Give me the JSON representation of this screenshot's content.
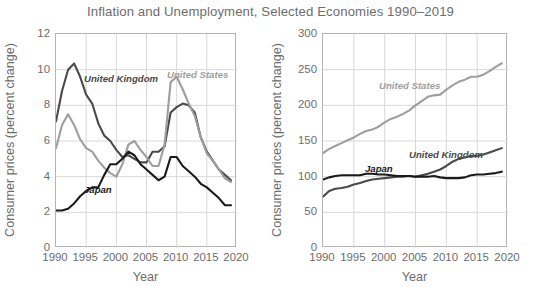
{
  "title": "Inflation and Unemployment, Selected Economies 1990–2019",
  "colors": {
    "united_kingdom": "#4a4a4a",
    "united_states": "#9e9e9e",
    "japan": "#1a1a1a",
    "axis": "#b4b4b4",
    "grid": "#d8d8d8",
    "text": "#6d6d6d"
  },
  "left": {
    "ylabel": "Consumer prices (percent change)",
    "xlabel": "Year",
    "yticks": [
      "0",
      "2",
      "4",
      "6",
      "8",
      "10",
      "12"
    ],
    "xticks": [
      "1990",
      "1995",
      "2000",
      "2005",
      "2010",
      "2015",
      "2020"
    ],
    "series_labels": {
      "united_kingdom": "United Kingdom",
      "united_states": "United States",
      "japan": "Japan"
    }
  },
  "right": {
    "ylabel": "Consumer prices (percent change)",
    "xlabel": "Year",
    "yticks": [
      "0",
      "50",
      "100",
      "150",
      "200",
      "250",
      "300"
    ],
    "xticks": [
      "1990",
      "1995",
      "2000",
      "2005",
      "2010",
      "2015",
      "2020"
    ],
    "series_labels": {
      "united_kingdom": "United Kingdom",
      "united_states": "United States",
      "japan": "Japan"
    }
  },
  "chart_data": [
    {
      "type": "line",
      "id": "left-panel",
      "title": "Inflation and Unemployment, Selected Economies 1990–2019",
      "xlabel": "Year",
      "ylabel": "Consumer prices (percent change)",
      "xlim": [
        1990,
        2020
      ],
      "ylim": [
        0,
        12
      ],
      "xticks": [
        1990,
        1995,
        2000,
        2005,
        2010,
        2015,
        2020
      ],
      "yticks": [
        0,
        2,
        4,
        6,
        8,
        10,
        12
      ],
      "grid": true,
      "legend": "inline-annotations",
      "x": [
        1990,
        1991,
        1992,
        1993,
        1994,
        1995,
        1996,
        1997,
        1998,
        1999,
        2000,
        2001,
        2002,
        2003,
        2004,
        2005,
        2006,
        2007,
        2008,
        2009,
        2010,
        2011,
        2012,
        2013,
        2014,
        2015,
        2016,
        2017,
        2018,
        2019
      ],
      "series": [
        {
          "name": "United Kingdom",
          "color": "#4a4a4a",
          "values": [
            7.1,
            8.8,
            10.0,
            10.35,
            9.6,
            8.6,
            8.1,
            7.0,
            6.3,
            6.0,
            5.5,
            5.1,
            5.2,
            5.0,
            4.8,
            4.8,
            5.4,
            5.4,
            5.7,
            7.6,
            7.9,
            8.1,
            8.0,
            7.6,
            6.2,
            5.4,
            4.9,
            4.4,
            4.1,
            3.8
          ],
          "series_type": "unemployment_rate_percent"
        },
        {
          "name": "United States",
          "color": "#9e9e9e",
          "values": [
            5.6,
            6.9,
            7.5,
            6.9,
            6.1,
            5.6,
            5.4,
            4.9,
            4.5,
            4.2,
            4.0,
            4.7,
            5.8,
            6.0,
            5.5,
            5.1,
            4.6,
            4.6,
            5.8,
            9.3,
            9.6,
            8.9,
            8.1,
            7.4,
            6.2,
            5.3,
            4.9,
            4.4,
            3.9,
            3.7
          ],
          "series_type": "unemployment_rate_percent"
        },
        {
          "name": "Japan",
          "color": "#1a1a1a",
          "values": [
            2.1,
            2.1,
            2.2,
            2.5,
            2.9,
            3.2,
            3.4,
            3.4,
            4.1,
            4.7,
            4.7,
            5.0,
            5.4,
            5.2,
            4.7,
            4.4,
            4.1,
            3.8,
            4.0,
            5.1,
            5.1,
            4.6,
            4.3,
            4.0,
            3.6,
            3.4,
            3.1,
            2.8,
            2.4,
            2.4
          ],
          "series_type": "unemployment_rate_percent"
        }
      ]
    },
    {
      "type": "line",
      "id": "right-panel",
      "title": "Inflation and Unemployment, Selected Economies 1990–2019",
      "xlabel": "Year",
      "ylabel": "Consumer prices (percent change)",
      "xlim": [
        1990,
        2020
      ],
      "ylim": [
        0,
        300
      ],
      "xticks": [
        1990,
        1995,
        2000,
        2005,
        2010,
        2015,
        2020
      ],
      "yticks": [
        0,
        50,
        100,
        150,
        200,
        250,
        300
      ],
      "grid": true,
      "legend": "inline-annotations",
      "x": [
        1990,
        1991,
        1992,
        1993,
        1994,
        1995,
        1996,
        1997,
        1998,
        1999,
        2000,
        2001,
        2002,
        2003,
        2004,
        2005,
        2006,
        2007,
        2008,
        2009,
        2010,
        2011,
        2012,
        2013,
        2014,
        2015,
        2016,
        2017,
        2018,
        2019
      ],
      "series": [
        {
          "name": "United States",
          "color": "#9e9e9e",
          "values": [
            133,
            139,
            143,
            147,
            151,
            155,
            160,
            164,
            166,
            170,
            176,
            181,
            184,
            188,
            193,
            200,
            206,
            212,
            214,
            215,
            222,
            228,
            233,
            236,
            240,
            240,
            243,
            248,
            254,
            259
          ],
          "series_type": "price_index_2005_equals_100"
        },
        {
          "name": "United Kingdom",
          "color": "#4a4a4a",
          "values": [
            72,
            80,
            83,
            84,
            86,
            89,
            91,
            94,
            96,
            97,
            98,
            99,
            100,
            100,
            101,
            100,
            102,
            104,
            107,
            110,
            115,
            121,
            125,
            127,
            129,
            129,
            131,
            134,
            137,
            140
          ],
          "series_type": "price_index_2005_equals_100"
        },
        {
          "name": "Japan",
          "color": "#1a1a1a",
          "values": [
            96,
            99,
            101,
            102,
            102,
            102,
            102,
            104,
            104,
            103,
            103,
            102,
            101,
            101,
            101,
            100,
            100,
            100,
            101,
            99,
            98,
            98,
            98,
            99,
            102,
            103,
            103,
            104,
            105,
            107
          ],
          "series_type": "price_index_2005_equals_100"
        }
      ]
    }
  ]
}
